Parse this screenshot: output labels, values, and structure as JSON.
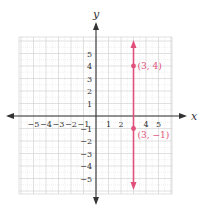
{
  "chart_data": {
    "type": "line",
    "title": "",
    "xlabel": "x",
    "ylabel": "y",
    "xlim": [
      -6,
      6
    ],
    "ylim": [
      -6,
      6
    ],
    "grid": true,
    "x_ticks": [
      -5,
      -4,
      -3,
      -2,
      -1,
      1,
      2,
      4,
      5
    ],
    "x_tick_labels": [
      "-5",
      "-4",
      "-3",
      "-2",
      "-1",
      "1",
      "2",
      "4",
      "5"
    ],
    "y_ticks": [
      5,
      4,
      3,
      2,
      1,
      -1,
      -2,
      -3,
      -4,
      -5
    ],
    "y_tick_labels": [
      "5",
      "4",
      "3",
      "2",
      "1",
      "-1",
      "-2",
      "-3",
      "-4",
      "-5"
    ],
    "series": [
      {
        "name": "x = 3",
        "kind": "vertical-line",
        "x": 3,
        "y_range": [
          -6,
          6
        ],
        "arrows": "both",
        "color": "#e0507a"
      }
    ],
    "points": [
      {
        "x": 3,
        "y": 4,
        "label": "(3, 4)",
        "color": "#e0507a"
      },
      {
        "x": 3,
        "y": -1,
        "label": "(3, −1)",
        "color": "#e0507a"
      }
    ],
    "axis_color": "#333333",
    "grid_color": "#cccccc"
  }
}
